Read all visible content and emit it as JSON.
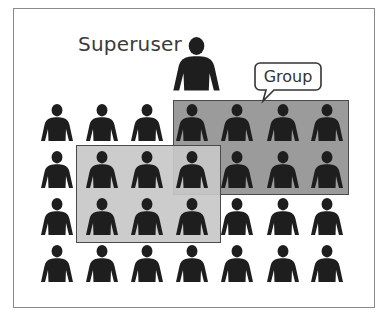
{
  "diagram": {
    "superuser_label": "Superuser",
    "group_label": "Group",
    "colors": {
      "frame_border": "#8a8a8a",
      "person_fill": "#1e1e1e",
      "group_fill": "#9b9b9b",
      "selection_fill": "#c8c8c8",
      "rect_border": "#4a4a4a",
      "text": "#3a3a3a"
    },
    "superuser": {
      "icon": "person-icon",
      "x": 173,
      "y": 37,
      "width": 47,
      "height": 55
    },
    "grid": {
      "icon": "person-icon",
      "rows": 4,
      "columns": 7,
      "column_centers": [
        57,
        102,
        147,
        192,
        237,
        283,
        327
      ],
      "row_tops": [
        104,
        151,
        198,
        245
      ],
      "icon_width": 32,
      "icon_height": 38
    },
    "group_rect": {
      "x": 173,
      "y": 100,
      "width": 176,
      "height": 95,
      "covers_rows": [
        1,
        2
      ],
      "covers_columns": [
        4,
        5,
        6,
        7
      ]
    },
    "selection_rect": {
      "x": 76,
      "y": 145,
      "width": 145,
      "height": 98,
      "covers_rows": [
        2,
        3
      ],
      "covers_columns": [
        2,
        3,
        4
      ]
    }
  }
}
